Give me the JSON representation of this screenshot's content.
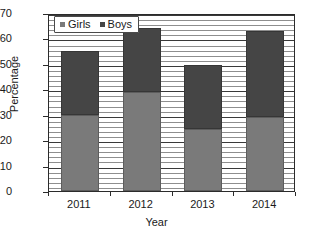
{
  "chart_data": {
    "type": "bar",
    "stacked": true,
    "title": "",
    "xlabel": "Year",
    "ylabel": "Percentage",
    "categories": [
      "2011",
      "2012",
      "2013",
      "2014"
    ],
    "series": [
      {
        "name": "Girls",
        "color": "#7a7a7a",
        "values": [
          30,
          39,
          24.5,
          29
        ]
      },
      {
        "name": "Boys",
        "color": "#454545",
        "values": [
          25,
          25,
          25,
          34
        ]
      }
    ],
    "totals": [
      55,
      64,
      49.5,
      63
    ],
    "ylim": [
      0,
      70
    ],
    "ytick_labels": [
      "0",
      "10",
      "20",
      "30",
      "40",
      "50",
      "60",
      "70"
    ],
    "ytick_values": [
      0,
      10,
      20,
      30,
      40,
      50,
      60,
      70
    ],
    "minor_tick_step": 2,
    "grid": true,
    "legend_position": "top-left",
    "legend_entries": [
      "Girls",
      "Boys"
    ]
  },
  "axis": {
    "y_title": "Percentage",
    "x_title": "Year",
    "y_labels": [
      "70",
      "60",
      "50",
      "40",
      "30",
      "20",
      "10",
      "0"
    ],
    "x_labels": [
      "2011",
      "2012",
      "2013",
      "2014"
    ]
  },
  "legend": {
    "items": [
      {
        "label": "Girls",
        "swatch": "girls-swatch-icon"
      },
      {
        "label": "Boys",
        "swatch": "boys-swatch-icon"
      }
    ]
  },
  "colors": {
    "girls": "#7a7a7a",
    "boys": "#454545",
    "frame": "#2b2b2b",
    "minor_grid": "#8e8e8e",
    "major_grid": "#3a3a3a",
    "background": "#ffffff"
  }
}
